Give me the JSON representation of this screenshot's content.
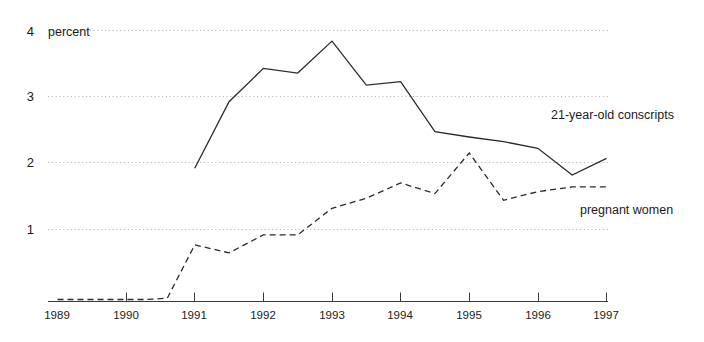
{
  "chart_data": {
    "type": "line",
    "title": "",
    "subtitle": "",
    "xlabel": "",
    "ylabel": "percent",
    "unit_label": "percent",
    "xlim": [
      1989,
      1997
    ],
    "ylim": [
      0,
      4
    ],
    "grid": true,
    "grid_style": "dotted-horizontal",
    "legend_position": "inline-right",
    "x_tick_labels": [
      "1989",
      "1990",
      "1991",
      "1992",
      "1993",
      "1994",
      "1995",
      "1996",
      "1997"
    ],
    "x_ticks": [
      1989,
      1990,
      1991,
      1992,
      1993,
      1994,
      1995,
      1996,
      1997
    ],
    "y_tick_labels": [
      "1",
      "2",
      "3",
      "4"
    ],
    "y_ticks": [
      1,
      2,
      3,
      4
    ],
    "series": [
      {
        "name": "21-year-old conscripts",
        "line_style": "solid",
        "color": "#2b2b2b",
        "x": [
          1991,
          1991.5,
          1992,
          1992.5,
          1993,
          1993.5,
          1994,
          1994.5,
          1995,
          1995.5,
          1996,
          1996.5,
          1997
        ],
        "values": [
          2.0,
          3.0,
          3.5,
          3.43,
          3.91,
          3.25,
          3.3,
          2.55,
          2.47,
          2.4,
          2.3,
          1.9,
          2.15
        ]
      },
      {
        "name": "pregnant women",
        "line_style": "dashed",
        "color": "#2b2b2b",
        "x": [
          1989,
          1989.5,
          1990,
          1990.3,
          1990.6,
          1991,
          1991.5,
          1992,
          1992.5,
          1993,
          1993.5,
          1994,
          1994.5,
          1995,
          1995.5,
          1996,
          1996.5,
          1997
        ],
        "values": [
          0.03,
          0.03,
          0.03,
          0.03,
          0.05,
          0.85,
          0.73,
          1.0,
          1.0,
          1.4,
          1.55,
          1.78,
          1.62,
          2.23,
          1.52,
          1.65,
          1.72,
          1.72
        ]
      }
    ],
    "annotations": [
      {
        "text": "21-year-old conscripts",
        "x": 1996.0,
        "y": 2.62
      },
      {
        "text": "pregnant women",
        "x": 1996.4,
        "y": 1.22
      }
    ]
  },
  "axis": {
    "unit": "percent",
    "y_labels": [
      "4",
      "3",
      "2",
      "1"
    ],
    "x_labels": [
      "1989",
      "1990",
      "1991",
      "1992",
      "1993",
      "1994",
      "1995",
      "1996",
      "1997"
    ]
  },
  "legend": {
    "conscripts": "21-year-old conscripts",
    "pregnant": "pregnant women"
  },
  "colors": {
    "line": "#2b2b2b",
    "grid": "#b9b9b9",
    "axis": "#3a3a3a",
    "text": "#1b1b1b",
    "background": "#ffffff"
  }
}
